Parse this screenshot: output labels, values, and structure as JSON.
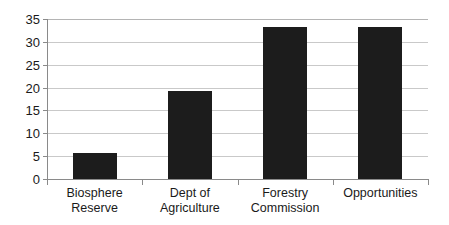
{
  "chart_data": {
    "type": "bar",
    "title": "",
    "subtitle": "",
    "xlabel": "",
    "ylabel": "",
    "categories": [
      "Biosphere Reserve",
      "Dept of Agriculture",
      "Forestry Commission",
      "Opportunities"
    ],
    "category_lines": [
      [
        "Biosphere",
        "Reserve"
      ],
      [
        "Dept of",
        "Agriculture"
      ],
      [
        "Forestry",
        "Commission"
      ],
      [
        "Opportunities",
        ""
      ]
    ],
    "values": [
      5.7,
      19.3,
      33.3,
      33.3
    ],
    "ylim": [
      0,
      35
    ],
    "ytick_labels": [
      "0",
      "5",
      "10",
      "15",
      "20",
      "25",
      "30",
      "35"
    ],
    "ytick_values": [
      0,
      5,
      10,
      15,
      20,
      25,
      30,
      35
    ],
    "grid": true,
    "legend": false,
    "legend_position": "none",
    "bar_color": "#1c1c1c",
    "gridline_color": "#c9c9c9",
    "axis_color": "#8a8a8a",
    "background_color": "#ffffff",
    "text_color": "#1a1a1a"
  }
}
